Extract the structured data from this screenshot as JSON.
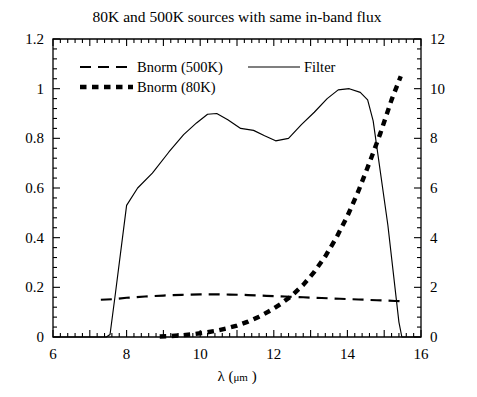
{
  "chart_data": {
    "type": "line",
    "title": "80K and 500K sources with same in-band flux",
    "xlabel_parts": {
      "symbol": "λ",
      "open": " (",
      "unit": "μm",
      "close": " )"
    },
    "xlabel": "λ (μm )",
    "ylabel_left": "",
    "ylabel_right": "",
    "xlim": [
      6,
      16
    ],
    "ylim_left": [
      0,
      1.2
    ],
    "ylim_right": [
      0,
      12
    ],
    "xticks": [
      6,
      7,
      8,
      9,
      10,
      11,
      12,
      13,
      14,
      15,
      16
    ],
    "xticklabels": [
      "6",
      "",
      "8",
      "",
      "10",
      "",
      "12",
      "",
      "14",
      "",
      "16"
    ],
    "yticks_left": [
      0,
      0.2,
      0.4,
      0.6,
      0.8,
      1,
      1.2
    ],
    "yticklabels_left": [
      "0",
      "0.2",
      "0.4",
      "0.6",
      "0.8",
      "1",
      "1.2"
    ],
    "yticks_right": [
      0,
      2,
      4,
      6,
      8,
      10,
      12
    ],
    "yticklabels_right": [
      "0",
      "2",
      "4",
      "6",
      "8",
      "10",
      "12"
    ],
    "xminor_count": 4,
    "yminor_count": 4,
    "grid": false,
    "legend_position": "top-inside",
    "series": [
      {
        "name": "Bnorm (500K)",
        "style": "dashed",
        "axis": "left",
        "x": [
          7.3,
          7.6,
          8.0,
          8.5,
          9.0,
          9.5,
          10.0,
          10.4,
          10.8,
          11.3,
          11.8,
          12.3,
          12.8,
          13.3,
          13.8,
          14.3,
          14.8,
          15.3,
          15.55
        ],
        "y": [
          0.15,
          0.152,
          0.158,
          0.163,
          0.167,
          0.17,
          0.172,
          0.172,
          0.171,
          0.169,
          0.166,
          0.163,
          0.16,
          0.157,
          0.154,
          0.151,
          0.148,
          0.145,
          0.143
        ]
      },
      {
        "name": "Bnorm (80K)",
        "style": "thick-dotted",
        "axis": "left",
        "x": [
          8.9,
          9.2,
          9.5,
          9.8,
          10.1,
          10.4,
          10.7,
          11.0,
          11.3,
          11.6,
          11.9,
          12.2,
          12.5,
          12.8,
          13.1,
          13.4,
          13.7,
          14.0,
          14.3,
          14.6,
          14.9,
          15.2,
          15.45
        ],
        "y": [
          0.002,
          0.004,
          0.007,
          0.011,
          0.017,
          0.024,
          0.034,
          0.046,
          0.062,
          0.082,
          0.106,
          0.134,
          0.168,
          0.21,
          0.262,
          0.325,
          0.4,
          0.487,
          0.588,
          0.702,
          0.822,
          0.955,
          1.05
        ]
      },
      {
        "name": "Filter",
        "style": "solid",
        "axis": "left",
        "x": [
          6.0,
          7.45,
          7.55,
          7.7,
          8.0,
          8.3,
          8.7,
          9.15,
          9.55,
          9.9,
          10.2,
          10.45,
          10.75,
          11.1,
          11.45,
          11.75,
          12.05,
          12.4,
          12.75,
          13.1,
          13.45,
          13.75,
          14.05,
          14.35,
          14.55,
          14.7,
          15.1,
          15.4,
          15.48,
          16.0
        ],
        "y": [
          0.0,
          0.0,
          0.01,
          0.18,
          0.53,
          0.6,
          0.66,
          0.745,
          0.815,
          0.862,
          0.897,
          0.9,
          0.875,
          0.84,
          0.832,
          0.81,
          0.79,
          0.8,
          0.855,
          0.905,
          0.96,
          0.995,
          1.0,
          0.985,
          0.955,
          0.87,
          0.45,
          0.06,
          0.0,
          0.0
        ]
      }
    ],
    "legend": [
      {
        "label": "Bnorm (500K)",
        "style": "dashed"
      },
      {
        "label": "Bnorm (80K)",
        "style": "thick-dotted"
      },
      {
        "label": "Filter",
        "style": "solid"
      }
    ]
  }
}
